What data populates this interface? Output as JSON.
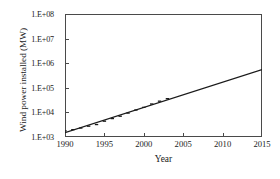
{
  "chart_data": {
    "type": "line",
    "title": "",
    "xlabel": "Year",
    "ylabel": "Wind power installed (MW)",
    "xlim": [
      1990,
      2015
    ],
    "ylim": [
      1000,
      100000000
    ],
    "yscale": "log",
    "xticks": [
      1990,
      1995,
      2000,
      2005,
      2010,
      2015
    ],
    "xtick_labels": [
      "1990",
      "1995",
      "2000",
      "2005",
      "2010",
      "2015"
    ],
    "yticks": [
      1000,
      10000,
      100000,
      1000000,
      10000000,
      100000000
    ],
    "ytick_labels": [
      "1.E+03",
      "1.E+04",
      "1.E+05",
      "1.E+06",
      "1.E+07",
      "1.E+08"
    ],
    "grid": false,
    "legend": false,
    "line_color": "#1a1a1a",
    "series": [
      {
        "name": "Wind power installed",
        "type": "trend-line",
        "x": [
          1990,
          2015
        ],
        "values": [
          1500,
          550000
        ]
      },
      {
        "name": "Observed data points",
        "type": "markers",
        "x": [
          1990,
          1991,
          1992,
          1993,
          1994,
          1995,
          1996,
          1997,
          1998,
          1999,
          2000,
          2001,
          2002,
          2003
        ],
        "values": [
          1930,
          2170,
          2510,
          2990,
          3490,
          4780,
          6100,
          7600,
          10200,
          13600,
          17400,
          23900,
          31100,
          39400
        ]
      }
    ]
  },
  "axis": {
    "y_title": "Wind power installed (MW)",
    "x_title": "Year"
  }
}
